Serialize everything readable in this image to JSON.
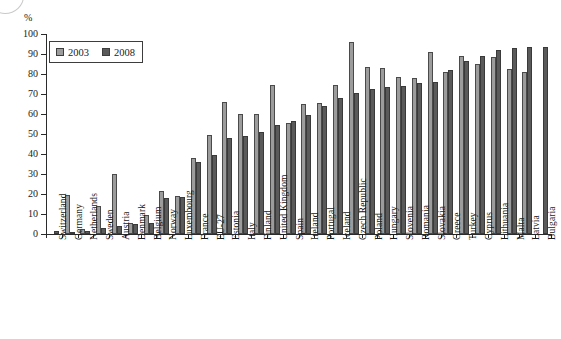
{
  "axis": {
    "unit_label": "%",
    "y_ticks": [
      0,
      10,
      20,
      30,
      40,
      50,
      60,
      70,
      80,
      90,
      100
    ]
  },
  "legend": {
    "items": [
      {
        "label": "2003",
        "color": "#9c9c9c",
        "key": "2003"
      },
      {
        "label": "2008",
        "color": "#5a5a5a",
        "key": "2008"
      }
    ]
  },
  "chart_data": {
    "type": "bar",
    "title": "",
    "subtitle": "",
    "xlabel": "",
    "ylabel": "%",
    "ylim": [
      0,
      100
    ],
    "grid": false,
    "legend_position": "top-left",
    "categories": [
      "Switzerland",
      "Germany",
      "Netherlands",
      "Sweden",
      "Austria",
      "Denmark",
      "Belgium",
      "Norway",
      "Luxembourg",
      "France",
      "EU-27",
      "Estonia",
      "Italy",
      "Finland",
      "United Kingdom",
      "Spain",
      "Ireland",
      "Portugal",
      "Iceland",
      "Czech Republic",
      "Poland",
      "Hungary",
      "Slovenia",
      "Romania",
      "Slovakia",
      "Greece",
      "Turkey",
      "Cyprus",
      "Lithuania",
      "Malta",
      "Latvia",
      "Bulgaria"
    ],
    "series": [
      {
        "name": "2003",
        "color": "#9c9c9c",
        "values": [
          0,
          19.5,
          2.5,
          13.8,
          30.0,
          5.3,
          9.6,
          21.6,
          18.8,
          38.2,
          49.3,
          66.0,
          60.0,
          60.0,
          74.5,
          55.5,
          65.2,
          65.7,
          74.5,
          96.2,
          83.7,
          83.2,
          78.7,
          78.0,
          91.2,
          81.2,
          89.2,
          85.0,
          88.6,
          82.7,
          80.8,
          0
        ]
      },
      {
        "name": "2008",
        "color": "#5a5a5a",
        "values": [
          1.7,
          0.7,
          1.3,
          2.9,
          3.8,
          4.8,
          5.3,
          18.0,
          18.6,
          36.0,
          39.3,
          47.8,
          49.2,
          50.8,
          54.4,
          56.5,
          59.7,
          64.0,
          68.0,
          70.7,
          72.6,
          73.4,
          74.2,
          75.6,
          76.1,
          81.9,
          86.3,
          89.2,
          92.0,
          93.2,
          93.3,
          93.4
        ]
      }
    ]
  }
}
